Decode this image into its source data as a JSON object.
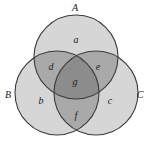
{
  "diagram": {
    "type": "venn-3",
    "colors": {
      "background": "#ffffff",
      "single": "#d6d6d6",
      "double": "#a9a9a9",
      "triple": "#8c8c8c",
      "stroke": "#3a3a3a",
      "text": "#222222"
    },
    "sets": [
      {
        "id": "A",
        "label": "A",
        "cx": 76,
        "cy": 57,
        "r": 42,
        "label_x": 75,
        "label_y": 11
      },
      {
        "id": "B",
        "label": "B",
        "cx": 57,
        "cy": 93,
        "r": 42,
        "label_x": 8,
        "label_y": 98
      },
      {
        "id": "C",
        "label": "C",
        "cx": 96,
        "cy": 93,
        "r": 42,
        "label_x": 140,
        "label_y": 98
      }
    ],
    "regions": [
      {
        "id": "a",
        "label": "a",
        "sets": [
          "A"
        ],
        "x": 76,
        "y": 43
      },
      {
        "id": "b",
        "label": "b",
        "sets": [
          "B"
        ],
        "x": 41,
        "y": 104
      },
      {
        "id": "c",
        "label": "c",
        "sets": [
          "C"
        ],
        "x": 110,
        "y": 104
      },
      {
        "id": "d",
        "label": "d",
        "sets": [
          "A",
          "B"
        ],
        "x": 51,
        "y": 70
      },
      {
        "id": "e",
        "label": "e",
        "sets": [
          "A",
          "C"
        ],
        "x": 98,
        "y": 70
      },
      {
        "id": "f",
        "label": "f",
        "sets": [
          "B",
          "C"
        ],
        "x": 76,
        "y": 119
      },
      {
        "id": "g",
        "label": "g",
        "sets": [
          "A",
          "B",
          "C"
        ],
        "x": 75,
        "y": 85
      }
    ]
  }
}
